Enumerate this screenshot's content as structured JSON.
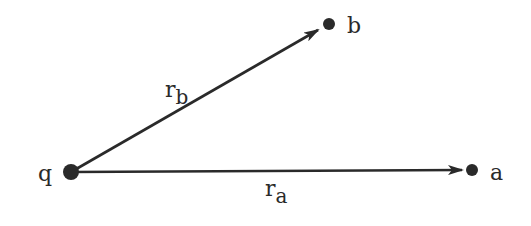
{
  "diagram": {
    "title": "",
    "colors": {
      "ink": "#2a2a2a",
      "background": "#ffffff"
    },
    "points": {
      "q": {
        "label": "q",
        "x": 71,
        "y": 172
      },
      "a": {
        "label": "a",
        "x": 472,
        "y": 170
      },
      "b": {
        "label": "b",
        "x": 329,
        "y": 24
      }
    },
    "vectors": [
      {
        "from": "q",
        "to": "b",
        "label": "r",
        "subscript": "b"
      },
      {
        "from": "q",
        "to": "a",
        "label": "r",
        "subscript": "a"
      }
    ],
    "labels": {
      "q": "q",
      "a": "a",
      "b": "b",
      "rb_main": "r",
      "rb_sub": "b",
      "ra_main": "r",
      "ra_sub": "a"
    }
  }
}
